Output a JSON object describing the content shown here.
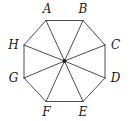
{
  "figure": {
    "kind": "regular-octagon-with-diagonals",
    "background_color": "#ffffff",
    "stroke_color": "#3a3a3a",
    "stroke_width": 0.9,
    "label_color": "#1a1a1a",
    "center": {
      "x": 64.5,
      "y": 61,
      "dot_radius": 1.9,
      "dot_color": "#1a1a1a"
    },
    "vertices": [
      {
        "id": "A",
        "label": "A",
        "x": 46.0,
        "y": 20.5,
        "label_x": 47.0,
        "label_y": 9.0
      },
      {
        "id": "B",
        "label": "B",
        "x": 83.0,
        "y": 20.5,
        "label_x": 83.0,
        "label_y": 9.0
      },
      {
        "id": "C",
        "label": "C",
        "x": 105.0,
        "y": 45.0,
        "label_x": 115.5,
        "label_y": 45.0
      },
      {
        "id": "D",
        "label": "D",
        "x": 105.0,
        "y": 78.0,
        "label_x": 115.5,
        "label_y": 77.5
      },
      {
        "id": "E",
        "label": "E",
        "x": 83.0,
        "y": 101.5,
        "label_x": 83.0,
        "label_y": 112.0
      },
      {
        "id": "F",
        "label": "F",
        "x": 46.0,
        "y": 101.5,
        "label_x": 46.5,
        "label_y": 112.0
      },
      {
        "id": "G",
        "label": "G",
        "x": 24.0,
        "y": 78.0,
        "label_x": 13.5,
        "label_y": 77.5
      },
      {
        "id": "H",
        "label": "H",
        "x": 24.0,
        "y": 45.0,
        "label_x": 13.5,
        "label_y": 45.0
      }
    ],
    "edges": [
      [
        "A",
        "B"
      ],
      [
        "B",
        "C"
      ],
      [
        "C",
        "D"
      ],
      [
        "D",
        "E"
      ],
      [
        "E",
        "F"
      ],
      [
        "F",
        "G"
      ],
      [
        "G",
        "H"
      ],
      [
        "H",
        "A"
      ]
    ],
    "radii": [
      "A",
      "B",
      "C",
      "D",
      "E",
      "F",
      "G",
      "H"
    ]
  }
}
